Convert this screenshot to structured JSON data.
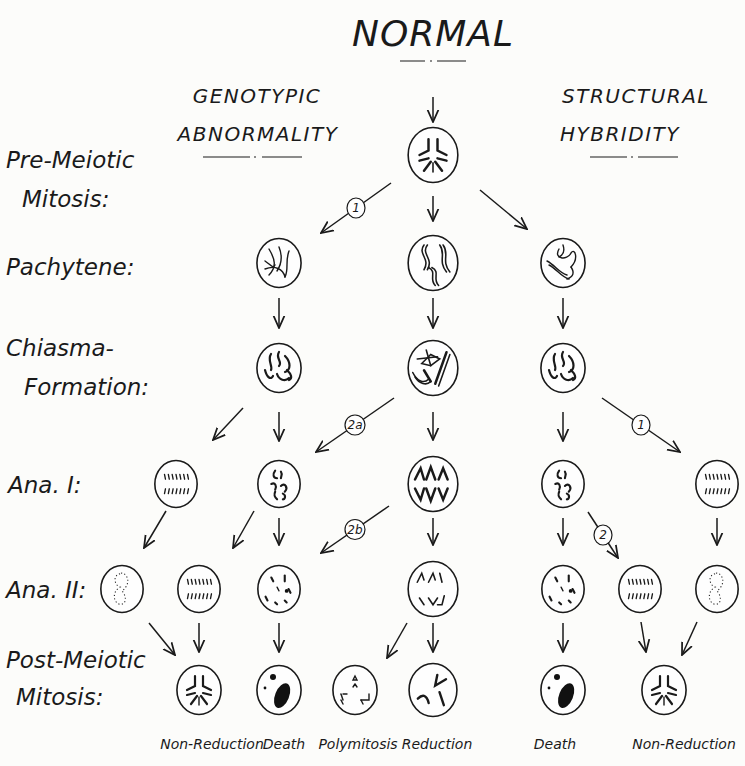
{
  "title": "NORMAL",
  "headers": {
    "left_line1": "GENOTYPIC",
    "left_line2": "ABNORMALITY",
    "right_line1": "STRUCTURAL",
    "right_line2": "HYBRIDITY"
  },
  "stages": [
    {
      "id": "pre-meiotic-mitosis",
      "line1": "Pre-Meiotic",
      "line2": "Mitosis:"
    },
    {
      "id": "pachytene",
      "line1": "Pachytene:",
      "line2": ""
    },
    {
      "id": "chiasma-formation",
      "line1": "Chiasma-",
      "line2": "Formation:"
    },
    {
      "id": "ana-i",
      "line1": "Ana. I:",
      "line2": ""
    },
    {
      "id": "ana-ii",
      "line1": "Ana. II:",
      "line2": ""
    },
    {
      "id": "post-meiotic-mitosis",
      "line1": "Post-Meiotic",
      "line2": "Mitosis:"
    }
  ],
  "nodes": [
    {
      "id": "n-normal",
      "stage": "pre-meiotic-mitosis",
      "x": 433,
      "y": 155,
      "r": 27,
      "type": "mitosis-normal"
    },
    {
      "id": "n-pach-left",
      "stage": "pachytene",
      "x": 279,
      "y": 263,
      "r": 24,
      "type": "pachytene-tangled"
    },
    {
      "id": "n-pach-center",
      "stage": "pachytene",
      "x": 433,
      "y": 263,
      "r": 27,
      "type": "pachytene-paired"
    },
    {
      "id": "n-pach-right",
      "stage": "pachytene",
      "x": 563,
      "y": 263,
      "r": 24,
      "type": "pachytene-loop"
    },
    {
      "id": "n-chi-left",
      "stage": "chiasma-formation",
      "x": 279,
      "y": 368,
      "r": 24,
      "type": "chiasma-univalents"
    },
    {
      "id": "n-chi-center",
      "stage": "chiasma-formation",
      "x": 433,
      "y": 368,
      "r": 27,
      "type": "chiasma-cross"
    },
    {
      "id": "n-chi-right",
      "stage": "chiasma-formation",
      "x": 563,
      "y": 368,
      "r": 24,
      "type": "chiasma-univalents"
    },
    {
      "id": "n-a1-1",
      "stage": "ana-i",
      "x": 176,
      "y": 484,
      "r": 23,
      "type": "ana-split-many"
    },
    {
      "id": "n-a1-2",
      "stage": "ana-i",
      "x": 279,
      "y": 484,
      "r": 23,
      "type": "ana-scattered"
    },
    {
      "id": "n-a1-3",
      "stage": "ana-i",
      "x": 433,
      "y": 484,
      "r": 27,
      "type": "ana-normal"
    },
    {
      "id": "n-a1-4",
      "stage": "ana-i",
      "x": 563,
      "y": 484,
      "r": 23,
      "type": "ana-scattered"
    },
    {
      "id": "n-a1-5",
      "stage": "ana-i",
      "x": 717,
      "y": 484,
      "r": 23,
      "type": "ana-split-many"
    },
    {
      "id": "n-a2-1",
      "stage": "ana-ii",
      "x": 122,
      "y": 589,
      "r": 23,
      "type": "restitution-nucleus"
    },
    {
      "id": "n-a2-2",
      "stage": "ana-ii",
      "x": 199,
      "y": 589,
      "r": 23,
      "type": "ana-split-many"
    },
    {
      "id": "n-a2-3",
      "stage": "ana-ii",
      "x": 279,
      "y": 589,
      "r": 23,
      "type": "ana2-fragments"
    },
    {
      "id": "n-a2-4",
      "stage": "ana-ii",
      "x": 433,
      "y": 589,
      "r": 27,
      "type": "ana2-normal"
    },
    {
      "id": "n-a2-5",
      "stage": "ana-ii",
      "x": 563,
      "y": 589,
      "r": 23,
      "type": "ana2-fragments"
    },
    {
      "id": "n-a2-6",
      "stage": "ana-ii",
      "x": 640,
      "y": 589,
      "r": 23,
      "type": "ana-split-many"
    },
    {
      "id": "n-a2-7",
      "stage": "ana-ii",
      "x": 717,
      "y": 589,
      "r": 23,
      "type": "restitution-nucleus"
    },
    {
      "id": "n-pm-1",
      "stage": "post-meiotic-mitosis",
      "x": 199,
      "y": 690,
      "r": 24,
      "type": "mitosis-normal",
      "outcome": "Non-Reduction"
    },
    {
      "id": "n-pm-2",
      "stage": "post-meiotic-mitosis",
      "x": 279,
      "y": 690,
      "r": 24,
      "type": "death",
      "outcome": "Death"
    },
    {
      "id": "n-pm-3",
      "stage": "post-meiotic-mitosis",
      "x": 355,
      "y": 690,
      "r": 24,
      "type": "polymitosis",
      "outcome": "Polymitosis"
    },
    {
      "id": "n-pm-4",
      "stage": "post-meiotic-mitosis",
      "x": 433,
      "y": 690,
      "r": 26,
      "type": "reduction",
      "outcome": "Reduction"
    },
    {
      "id": "n-pm-5",
      "stage": "post-meiotic-mitosis",
      "x": 563,
      "y": 690,
      "r": 24,
      "type": "death",
      "outcome": "Death"
    },
    {
      "id": "n-pm-6",
      "stage": "post-meiotic-mitosis",
      "x": 664,
      "y": 690,
      "r": 24,
      "type": "mitosis-normal",
      "outcome": "Non-Reduction"
    }
  ],
  "edges": [
    {
      "from": [
        433,
        97
      ],
      "to": [
        433,
        122
      ],
      "label": ""
    },
    {
      "from": [
        391,
        183
      ],
      "to": [
        321,
        233
      ],
      "label": "1"
    },
    {
      "from": [
        433,
        196
      ],
      "to": [
        433,
        221
      ],
      "label": ""
    },
    {
      "from": [
        480,
        190
      ],
      "to": [
        527,
        229
      ],
      "label": ""
    },
    {
      "from": [
        279,
        298
      ],
      "to": [
        279,
        328
      ],
      "label": ""
    },
    {
      "from": [
        433,
        298
      ],
      "to": [
        433,
        328
      ],
      "label": ""
    },
    {
      "from": [
        563,
        298
      ],
      "to": [
        563,
        328
      ],
      "label": ""
    },
    {
      "from": [
        243,
        408
      ],
      "to": [
        213,
        440
      ],
      "label": ""
    },
    {
      "from": [
        279,
        412
      ],
      "to": [
        279,
        441
      ],
      "label": ""
    },
    {
      "from": [
        394,
        398
      ],
      "to": [
        316,
        452
      ],
      "label": "2a"
    },
    {
      "from": [
        433,
        412
      ],
      "to": [
        433,
        440
      ],
      "label": ""
    },
    {
      "from": [
        563,
        412
      ],
      "to": [
        563,
        441
      ],
      "label": ""
    },
    {
      "from": [
        602,
        398
      ],
      "to": [
        680,
        452
      ],
      "label": "1"
    },
    {
      "from": [
        166,
        511
      ],
      "to": [
        144,
        548
      ],
      "label": ""
    },
    {
      "from": [
        254,
        511
      ],
      "to": [
        233,
        548
      ],
      "label": ""
    },
    {
      "from": [
        279,
        518
      ],
      "to": [
        279,
        545
      ],
      "label": ""
    },
    {
      "from": [
        389,
        506
      ],
      "to": [
        321,
        553
      ],
      "label": "2b"
    },
    {
      "from": [
        433,
        518
      ],
      "to": [
        433,
        545
      ],
      "label": ""
    },
    {
      "from": [
        563,
        518
      ],
      "to": [
        563,
        545
      ],
      "label": ""
    },
    {
      "from": [
        588,
        512
      ],
      "to": [
        618,
        558
      ],
      "label": "2"
    },
    {
      "from": [
        717,
        518
      ],
      "to": [
        717,
        545
      ],
      "label": ""
    },
    {
      "from": [
        149,
        623
      ],
      "to": [
        175,
        655
      ],
      "label": ""
    },
    {
      "from": [
        199,
        623
      ],
      "to": [
        199,
        652
      ],
      "label": ""
    },
    {
      "from": [
        279,
        623
      ],
      "to": [
        279,
        652
      ],
      "label": ""
    },
    {
      "from": [
        407,
        623
      ],
      "to": [
        387,
        658
      ],
      "label": ""
    },
    {
      "from": [
        433,
        623
      ],
      "to": [
        433,
        652
      ],
      "label": ""
    },
    {
      "from": [
        563,
        623
      ],
      "to": [
        563,
        652
      ],
      "label": ""
    },
    {
      "from": [
        641,
        622
      ],
      "to": [
        646,
        652
      ],
      "label": ""
    },
    {
      "from": [
        697,
        622
      ],
      "to": [
        682,
        655
      ],
      "label": ""
    }
  ],
  "outcomes": [
    {
      "label": "Non-Reduction",
      "x": 212
    },
    {
      "label": "Death",
      "x": 284
    },
    {
      "label": "Polymitosis",
      "x": 358
    },
    {
      "label": "Reduction",
      "x": 437
    },
    {
      "label": "Death",
      "x": 555
    },
    {
      "label": "Non-Reduction",
      "x": 684
    }
  ]
}
